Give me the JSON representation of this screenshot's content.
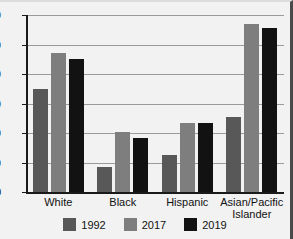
{
  "chart_data": {
    "type": "bar",
    "title": "",
    "xlabel": "",
    "ylabel": "",
    "ylim": [
      0,
      60
    ],
    "yticks": [
      0,
      10,
      20,
      30,
      40,
      50,
      60
    ],
    "ytick_labels": [
      "0",
      "10",
      "20",
      "30",
      "40",
      "50",
      "60"
    ],
    "grid": true,
    "legend_position": "bottom",
    "categories": [
      "White",
      "Black",
      "Hispanic",
      "Asian/Pacific\nIslander"
    ],
    "series": [
      {
        "name": "1992",
        "color": "#585858",
        "values": [
          35,
          8.5,
          12.5,
          25.5
        ]
      },
      {
        "name": "2017",
        "color": "#7e7e7e",
        "values": [
          47,
          20.5,
          23.5,
          57
        ]
      },
      {
        "name": "2019",
        "color": "#121212",
        "values": [
          45,
          18.3,
          23.3,
          55.5
        ]
      }
    ]
  }
}
